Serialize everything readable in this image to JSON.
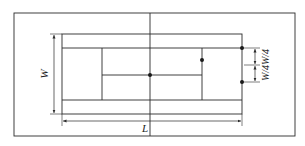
{
  "diagram": {
    "labels": {
      "width": "W",
      "length": "L",
      "quarter_width": "W/4W/4"
    },
    "colors": {
      "line": "#2a2a2a",
      "background": "#ffffff"
    },
    "points": [
      {
        "name": "center-point",
        "x": 150,
        "y": 75
      },
      {
        "name": "service-line-point",
        "x": 202,
        "y": 60
      },
      {
        "name": "baseline-top-point",
        "x": 242,
        "y": 48
      },
      {
        "name": "baseline-mid-point",
        "x": 242,
        "y": 82
      }
    ]
  }
}
